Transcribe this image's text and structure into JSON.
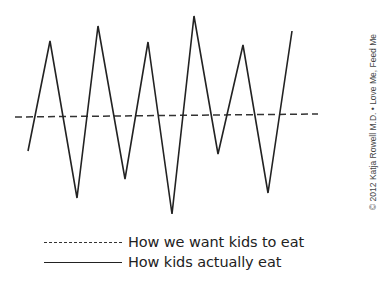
{
  "chart_data": {
    "type": "line",
    "title": "",
    "xlabel": "",
    "ylabel": "",
    "grid": false,
    "axes_visible": false,
    "legend_position": "bottom-left",
    "series": [
      {
        "name": "How we want kids to eat",
        "style": "dashed",
        "color": "#333333",
        "points": [
          [
            15,
            117
          ],
          [
            318,
            114
          ]
        ]
      },
      {
        "name": "How kids actually eat",
        "style": "solid",
        "color": "#222222",
        "points": [
          [
            28,
            151
          ],
          [
            50,
            41
          ],
          [
            77,
            198
          ],
          [
            98,
            26
          ],
          [
            125,
            179
          ],
          [
            148,
            42
          ],
          [
            172,
            214
          ],
          [
            194,
            16
          ],
          [
            218,
            154
          ],
          [
            243,
            45
          ],
          [
            268,
            193
          ],
          [
            292,
            31
          ]
        ]
      }
    ]
  },
  "legend": {
    "items": [
      {
        "label": "How we want kids to eat",
        "style": "dashed"
      },
      {
        "label": "How kids actually eat",
        "style": "solid"
      }
    ]
  },
  "credit": "© 2012 Katja Rowell M.D. • Love Me, Feed Me"
}
